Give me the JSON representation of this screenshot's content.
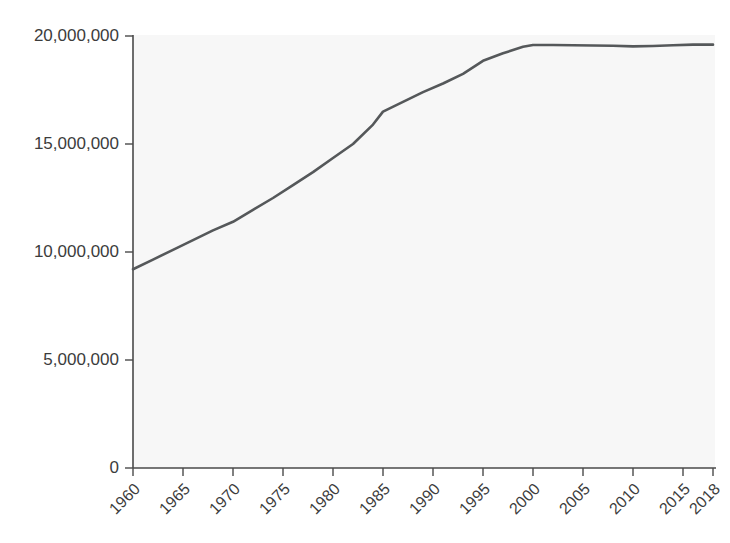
{
  "chart_data": {
    "type": "line",
    "title": "",
    "subtitle": "",
    "xlabel": "",
    "ylabel": "",
    "xlim": [
      1960,
      2018
    ],
    "ylim": [
      0,
      20000000
    ],
    "grid": false,
    "legend": null,
    "line_color": "#55585a",
    "background_color": "#f7f7f7",
    "axis_color": "#4a4a4a",
    "x_tick_labels": [
      "1960",
      "1965",
      "1970",
      "1975",
      "1980",
      "1985",
      "1990",
      "1995",
      "2000",
      "2005",
      "2010",
      "2015",
      "2018"
    ],
    "x_tick_values": [
      1960,
      1965,
      1970,
      1975,
      1980,
      1985,
      1990,
      1995,
      2000,
      2005,
      2010,
      2015,
      2018
    ],
    "y_tick_labels": [
      "0",
      "5,000,000",
      "10,000,000",
      "15,000,000",
      "20,000,000"
    ],
    "y_tick_values": [
      0,
      5000000,
      10000000,
      15000000,
      20000000
    ],
    "x_tick_label_rotation": -45,
    "series": [
      {
        "name": "",
        "x": [
          1960,
          1962,
          1964,
          1966,
          1968,
          1970,
          1972,
          1974,
          1976,
          1978,
          1980,
          1982,
          1984,
          1985,
          1987,
          1989,
          1991,
          1993,
          1995,
          1997,
          1999,
          2000,
          2002,
          2004,
          2006,
          2008,
          2010,
          2012,
          2014,
          2016,
          2018
        ],
        "values": [
          9200000,
          9650000,
          10100000,
          10550000,
          11000000,
          11400000,
          11950000,
          12500000,
          13100000,
          13700000,
          14350000,
          15000000,
          15900000,
          16500000,
          16950000,
          17400000,
          17800000,
          18250000,
          18850000,
          19200000,
          19500000,
          19580000,
          19580000,
          19570000,
          19560000,
          19550000,
          19520000,
          19540000,
          19570000,
          19600000,
          19600000
        ]
      }
    ]
  }
}
